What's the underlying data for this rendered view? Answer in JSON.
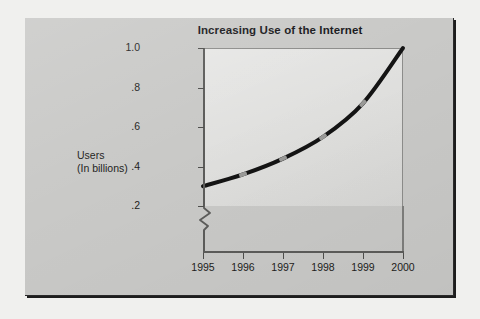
{
  "page": {
    "background_color": "#c9c9c7",
    "outer_background_color": "#f0f0ee"
  },
  "chart_data": {
    "type": "line",
    "title": "Increasing Use of the Internet",
    "xlabel": "",
    "ylabel": "Users\n(In billions)",
    "ylabel_line1": "Users",
    "ylabel_line2": "(In billions)",
    "categories": [
      "1995",
      "1996",
      "1997",
      "1998",
      "1999",
      "2000"
    ],
    "x": [
      1995,
      1996,
      1997,
      1998,
      1999,
      2000
    ],
    "values": [
      0.3,
      0.36,
      0.44,
      0.55,
      0.72,
      1.0
    ],
    "series": [
      {
        "name": "Users (In billions)",
        "values": [
          0.3,
          0.36,
          0.44,
          0.55,
          0.72,
          1.0
        ],
        "line_color": "#141414",
        "marker_color": "#9a9a98",
        "line_width": 4
      }
    ],
    "ylim": [
      0.2,
      1.0
    ],
    "xlim": [
      1995,
      2000
    ],
    "y_ticks": [
      1.0,
      0.8,
      0.6,
      0.4,
      0.2
    ],
    "y_tick_labels": [
      "1.0",
      ".8",
      ".6",
      ".4",
      ".2"
    ],
    "x_tick_labels": [
      "1995",
      "1996",
      "1997",
      "1998",
      "1999",
      "2000"
    ],
    "grid": false,
    "legend": false,
    "legend_position": "none",
    "y_axis_break": true,
    "annotations": [],
    "plot_background_color": "#dddddb",
    "axis_color": "#5c5c5a",
    "text_color": "#1d1d20"
  }
}
